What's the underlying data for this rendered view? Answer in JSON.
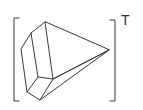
{
  "figure": {
    "superscript": "T",
    "stroke_color": "#3a3a3a"
  }
}
